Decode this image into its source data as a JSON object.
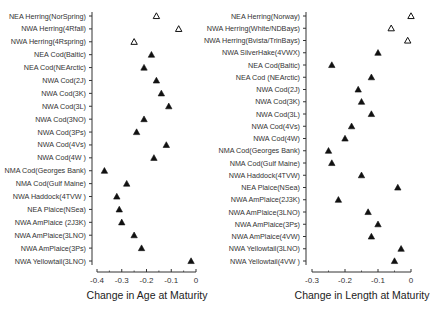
{
  "chart_data": [
    {
      "type": "scatter",
      "title": "",
      "xlabel": "Change in Age at Maturity",
      "ylabel": "",
      "xlim": [
        -0.4,
        0
      ],
      "xticks": [
        -0.4,
        -0.3,
        -0.2,
        -0.1,
        0
      ],
      "xtick_labels": [
        "-0.4",
        "-0.3",
        "-0.2",
        "-0.1",
        "0"
      ],
      "grid": false,
      "marker_legend": {
        "open_triangle": "Herring stocks",
        "filled_triangle": "Other stocks"
      },
      "categories": [
        "NEA Herring(NorSpring)",
        "NWA Herring(4Rfall)",
        "NWA Herring(4Rspring)",
        "NEA Cod(Baltic)",
        "NEA Cod(NEArctic)",
        "NWA Cod(2J)",
        "NWA Cod(3K)",
        "NWA Cod(3L)",
        "NWA Cod(3NO)",
        "NWA Cod(3Ps)",
        "NWA Cod(4Vs)",
        "NWA Cod(4W )",
        "NMA Cod(Georges Bank)",
        "NMA Cod(Gulf Maine)",
        "NWA Haddock(4TVW )",
        "NEA Plaice(NSea)",
        "NWA AmPlaice (2J3K)",
        "NWA AmPlaice(3LNO)",
        "NWA AmPlaice(3Ps)",
        "NWA Yellowtail(3LNO)"
      ],
      "values": [
        -0.16,
        -0.07,
        -0.25,
        -0.18,
        -0.21,
        -0.16,
        -0.14,
        -0.11,
        -0.21,
        -0.24,
        -0.12,
        -0.17,
        -0.37,
        -0.28,
        -0.32,
        -0.31,
        -0.3,
        -0.25,
        -0.22,
        -0.02
      ],
      "open_marker": [
        true,
        true,
        true,
        false,
        false,
        false,
        false,
        false,
        false,
        false,
        false,
        false,
        false,
        false,
        false,
        false,
        false,
        false,
        false,
        false
      ]
    },
    {
      "type": "scatter",
      "title": "",
      "xlabel": "Change in Length at Maturity",
      "ylabel": "",
      "xlim": [
        -0.3,
        0
      ],
      "xticks": [
        -0.3,
        -0.2,
        -0.1,
        0
      ],
      "xtick_labels": [
        "-0.3",
        "-0.2",
        "-0.1",
        "0"
      ],
      "grid": false,
      "categories": [
        "NEA Herring(Norway)",
        "NWA Herring(White/NDBays)",
        "NWA Herring(Bvista/TrinBays)",
        "NWA SilverHake(4VWX)",
        "NEA Cod(Baltic)",
        "NEA Cod (NEArctic)",
        "NWA Cod(2J)",
        "NWA Cod(3K)",
        "NWA Cod(3L)",
        "NWA Cod(4Vs)",
        "NWA Cod(4W)",
        "NMA Cod(Georges Bank)",
        "NMA Cod(Gulf Maine)",
        "NWA Haddock(4TVW)",
        "NEA Plaice(NSea)",
        "NWA AmPlaice(2J3K)",
        "NWA AmPlaice(3LNO)",
        "NWA AmPlaice(3Ps)",
        "NWA AmPlaice(4VW)",
        "NWA Yellowtail(3LNO)",
        "NWA Yellowtail(4VW )"
      ],
      "values": [
        0.0,
        -0.06,
        -0.01,
        -0.1,
        -0.24,
        -0.12,
        -0.16,
        -0.15,
        -0.12,
        -0.18,
        -0.2,
        -0.25,
        -0.24,
        -0.15,
        -0.04,
        -0.22,
        -0.13,
        -0.1,
        -0.12,
        -0.03,
        -0.05
      ],
      "open_marker": [
        true,
        true,
        true,
        false,
        false,
        false,
        false,
        false,
        false,
        false,
        false,
        false,
        false,
        false,
        false,
        false,
        false,
        false,
        false,
        false,
        false
      ]
    }
  ],
  "layout": [
    {
      "axis_x": 92,
      "y_top": 16,
      "y_bottom": 261,
      "x_axis_y": 214,
      "px_left": 97,
      "px_right": 196,
      "xaxis_y": 272,
      "ticklabel_y": 283,
      "xlabel_y": 299,
      "xlabel_cx": 147
    },
    {
      "axis_x": 306,
      "y_top": 16,
      "y_bottom": 261,
      "px_left": 312,
      "px_right": 411,
      "xaxis_y": 272,
      "ticklabel_y": 283,
      "xlabel_cx": 362,
      "xlabel_y": 299
    }
  ],
  "colors": {
    "marker": "#111111",
    "axis": "#333333",
    "text": "#333333"
  }
}
